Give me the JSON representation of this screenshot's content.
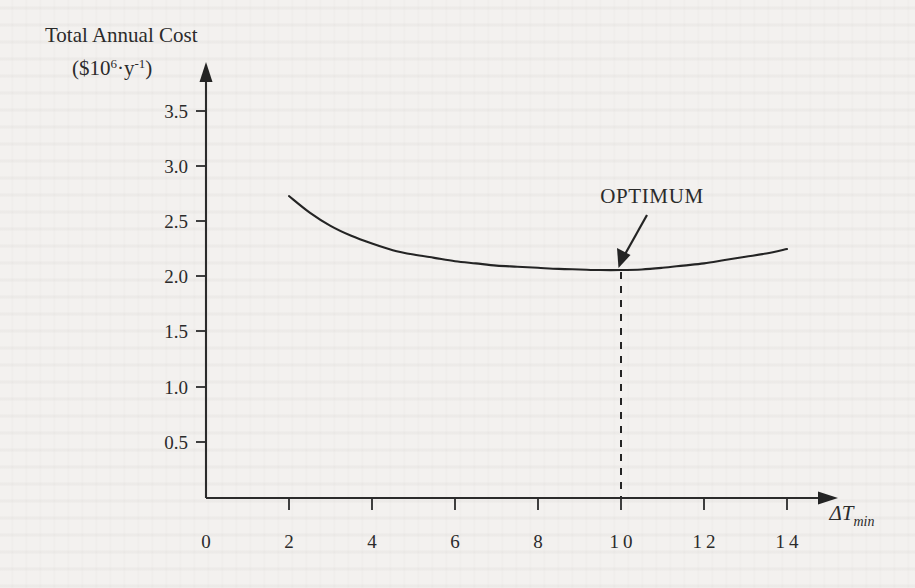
{
  "figure": {
    "background_color": "#f3f1ef",
    "ink_color": "#242424"
  },
  "axes": {
    "y_title_line1": "Total Annual Cost",
    "y_title_line2_prefix": "($10",
    "y_title_line2_sup1": "6",
    "y_title_line2_mid": "·y",
    "y_title_line2_sup2": "-1",
    "y_title_line2_suffix": ")",
    "x_title_delta": "ΔT",
    "x_title_subscript": "min",
    "origin_label": "0"
  },
  "annotations": {
    "optimum_label": "OPTIMUM",
    "optimum_x_value": 10,
    "optimum_y_value": 2.06
  },
  "chart_data": {
    "type": "line",
    "title": "",
    "subtitle": "",
    "xlabel": "ΔT_min",
    "ylabel": "Total Annual Cost ($10^6·y^-1)",
    "xlim": [
      0,
      15.2
    ],
    "ylim": [
      0,
      3.75
    ],
    "grid": false,
    "legend": null,
    "x_ticks": [
      0,
      2,
      4,
      6,
      8,
      10,
      12,
      14
    ],
    "x_tick_labels": [
      "0",
      "2",
      "4",
      "6",
      "8",
      "10",
      "12",
      "14"
    ],
    "y_ticks": [
      0.5,
      1.0,
      1.5,
      2.0,
      2.5,
      3.0,
      3.5
    ],
    "y_tick_labels": [
      "0.5",
      "1.0",
      "1.5",
      "2.0",
      "2.5",
      "3.0",
      "3.5"
    ],
    "series": [
      {
        "name": "Total annual cost",
        "style": "solid",
        "x": [
          2.0,
          2.5,
          3.0,
          3.5,
          4.0,
          4.5,
          5.0,
          5.5,
          6.0,
          6.5,
          7.0,
          7.5,
          8.0,
          8.5,
          9.0,
          9.5,
          10.0,
          10.5,
          11.0,
          11.5,
          12.0,
          12.5,
          13.0,
          13.5,
          14.0
        ],
        "y": [
          2.73,
          2.58,
          2.46,
          2.37,
          2.3,
          2.24,
          2.2,
          2.17,
          2.14,
          2.12,
          2.1,
          2.09,
          2.08,
          2.07,
          2.065,
          2.06,
          2.06,
          2.065,
          2.08,
          2.1,
          2.12,
          2.15,
          2.18,
          2.21,
          2.25
        ]
      }
    ],
    "markers": [
      {
        "name": "optimum",
        "x": 10,
        "y": 2.06,
        "label": "OPTIMUM",
        "guide": "dashed-vertical-to-x-axis"
      }
    ]
  }
}
